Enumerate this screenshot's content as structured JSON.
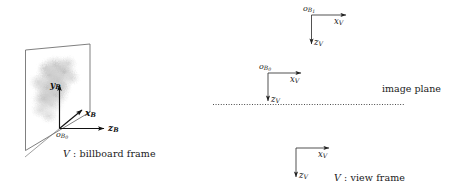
{
  "figure": {
    "background_color": "#ffffff",
    "stroke_color": "#555555",
    "axis_color": "#111111",
    "text_color": "#1a1a1a"
  },
  "billboard_panel": {
    "caption_frame_letter": "V",
    "caption_separator": " : ",
    "caption_text": "billboard frame",
    "caption_full": "V : billboard frame",
    "plane_label": "billboard-quad",
    "texture_label": "cloud-sprite",
    "axes": [
      {
        "name": "y-axis",
        "label_main": "y",
        "label_sub": "B",
        "direction": "up"
      },
      {
        "name": "x-axis",
        "label_main": "x",
        "label_sub": "B",
        "direction": "up-right-diagonal"
      },
      {
        "name": "z-axis",
        "label_main": "z",
        "label_sub": "B",
        "direction": "right"
      }
    ],
    "origin": {
      "main": "o",
      "sub": "B",
      "subsub": "0"
    }
  },
  "view_frames": [
    {
      "id": "frame-b1",
      "origin": {
        "main": "o",
        "sub": "B",
        "subsub": "1"
      },
      "x_axis": {
        "label_main": "x",
        "label_sub": "V",
        "direction": "right"
      },
      "z_axis": {
        "label_main": "z",
        "label_sub": "V",
        "direction": "down"
      }
    },
    {
      "id": "frame-b0",
      "origin": {
        "main": "o",
        "sub": "B",
        "subsub": "0"
      },
      "x_axis": {
        "label_main": "x",
        "label_sub": "V",
        "direction": "right"
      },
      "z_axis": {
        "label_main": "z",
        "label_sub": "V",
        "direction": "down"
      }
    },
    {
      "id": "frame-view",
      "origin": null,
      "x_axis": {
        "label_main": "x",
        "label_sub": "V",
        "direction": "right"
      },
      "z_axis": {
        "label_main": "z",
        "label_sub": "V",
        "direction": "down"
      }
    }
  ],
  "image_plane": {
    "label": "image plane",
    "line_style": "dotted"
  },
  "view_frame_caption": {
    "frame_letter": "V",
    "separator": " : ",
    "text": "view frame",
    "full": "V : view frame"
  }
}
